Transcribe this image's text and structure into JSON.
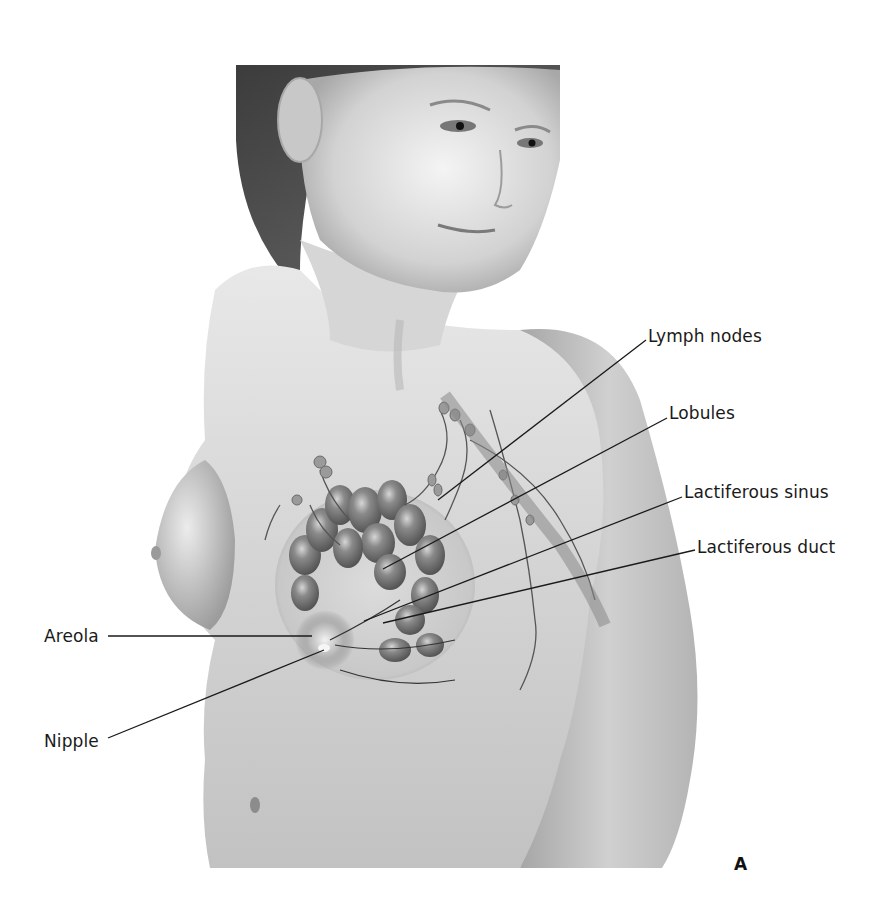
{
  "figure": {
    "panel_letter": "A",
    "colors": {
      "background": "#ffffff",
      "skin_light": "#e6e6e6",
      "skin_mid": "#c4c4c4",
      "skin_dark": "#8e8e8e",
      "hair": "#4a4a4a",
      "gland": "#6e6e6e",
      "gland_highlight": "#d8d8d8",
      "leader_line": "#1a1a1a"
    }
  },
  "labels": [
    {
      "id": "lymph-nodes",
      "text": "Lymph nodes",
      "x": 648,
      "y": 328,
      "line": [
        646,
        340,
        438,
        500
      ]
    },
    {
      "id": "lobules",
      "text": "Lobules",
      "x": 669,
      "y": 405,
      "line": [
        667,
        418,
        383,
        569
      ]
    },
    {
      "id": "lactiferous-sinus",
      "text": "Lactiferous sinus",
      "x": 684,
      "y": 484,
      "line": [
        682,
        497,
        364,
        621
      ]
    },
    {
      "id": "lactiferous-duct",
      "text": "Lactiferous duct",
      "x": 697,
      "y": 539,
      "line": [
        695,
        550,
        383,
        623
      ]
    },
    {
      "id": "areola",
      "text": "Areola",
      "x": 44,
      "y": 628,
      "line": [
        108,
        636,
        312,
        636
      ]
    },
    {
      "id": "nipple",
      "text": "Nipple",
      "x": 44,
      "y": 733,
      "line": [
        108,
        738,
        324,
        650
      ]
    }
  ]
}
